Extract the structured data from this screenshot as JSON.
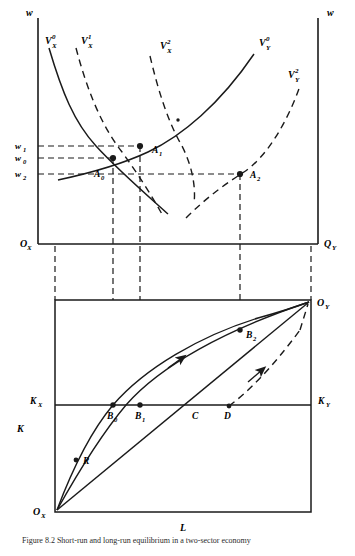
{
  "figure": {
    "caption": "Figure 8.2   Short-run and long-run equilibrium in a two-sector economy"
  },
  "colors": {
    "ink": "#1a1a1a",
    "axis": "#1a1a1a",
    "dash": "#1a1a1a",
    "background": "#ffffff"
  },
  "top_panel": {
    "name": "labour-market-panel",
    "axis_labels": {
      "left_vertical": "w",
      "right_vertical": "w",
      "left_origin": "O",
      "left_origin_sub": "X",
      "right_origin": "Q",
      "right_origin_sub": "Y"
    },
    "wage_ticks": [
      {
        "label": "w",
        "sub": "1",
        "value": 1
      },
      {
        "label": "w",
        "sub": "0",
        "value": 0
      },
      {
        "label": "w",
        "sub": "2",
        "value": 2
      }
    ],
    "curves": [
      {
        "name": "VX0",
        "base": "V",
        "sup": "0",
        "sub": "X",
        "style": "solid",
        "sector": "X"
      },
      {
        "name": "VX1",
        "base": "V",
        "sup": "1",
        "sub": "X",
        "style": "dashed",
        "sector": "X"
      },
      {
        "name": "VX2",
        "base": "V",
        "sup": "2",
        "sub": "X",
        "style": "dashed",
        "sector": "X"
      },
      {
        "name": "VY0",
        "base": "V",
        "sup": "0",
        "sub": "Y",
        "style": "solid",
        "sector": "Y"
      },
      {
        "name": "VY2",
        "base": "V",
        "sup": "2",
        "sub": "Y",
        "style": "dashed",
        "sector": "Y"
      }
    ],
    "equilibria": [
      {
        "label": "A",
        "sub": "0",
        "wage": "w0"
      },
      {
        "label": "A",
        "sub": "1",
        "wage": "w1"
      },
      {
        "label": "A",
        "sub": "2",
        "wage": "w2"
      }
    ]
  },
  "bottom_panel": {
    "name": "edgeworth-box-panel",
    "axis_labels": {
      "horizontal": "L",
      "vertical": "K",
      "origin_x": "O",
      "origin_x_sub": "X",
      "origin_y": "O",
      "origin_y_sub": "Y",
      "capital_left": "K",
      "capital_left_sub": "X",
      "capital_right": "K",
      "capital_right_sub": "Y"
    },
    "points": [
      {
        "label": "B",
        "sub": "0",
        "name": "point-b0"
      },
      {
        "label": "B",
        "sub": "1",
        "name": "point-b1"
      },
      {
        "label": "B",
        "sub": "2",
        "name": "point-b2"
      },
      {
        "label": "C",
        "sub": "",
        "name": "point-c"
      },
      {
        "label": "D",
        "sub": "",
        "name": "point-d"
      },
      {
        "label": "R",
        "sub": "",
        "name": "point-r"
      }
    ],
    "paths": [
      {
        "name": "contract-curve-upper",
        "style": "solid",
        "arrow": false
      },
      {
        "name": "expansion-path-b1",
        "style": "solid",
        "arrow": true
      },
      {
        "name": "ray-from-origin-c",
        "style": "solid",
        "arrow": false
      },
      {
        "name": "adjustment-path-d",
        "style": "dashed",
        "arrow": true
      }
    ]
  }
}
